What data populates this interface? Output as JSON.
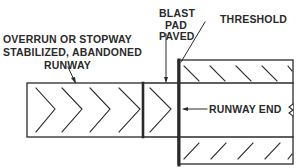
{
  "diagram": {
    "labels": {
      "overrun_line1": "OVERRUN OR STOPWAY",
      "overrun_line2": "STABILIZED, ABANDONED",
      "overrun_line3": "RUNWAY",
      "blast_line1": "BLAST",
      "blast_line2": "PAD",
      "blast_line3": "PAVED",
      "threshold": "THRESHOLD",
      "runway_end": "RUNWAY END"
    },
    "markings": {
      "overrun_chevrons": 4,
      "blast_pad_chevrons": 1,
      "upper_hatch_marks": 5,
      "lower_hatch_marks": 5
    },
    "colors": {
      "line": "#2a2a2a",
      "background": "#ffffff"
    }
  }
}
